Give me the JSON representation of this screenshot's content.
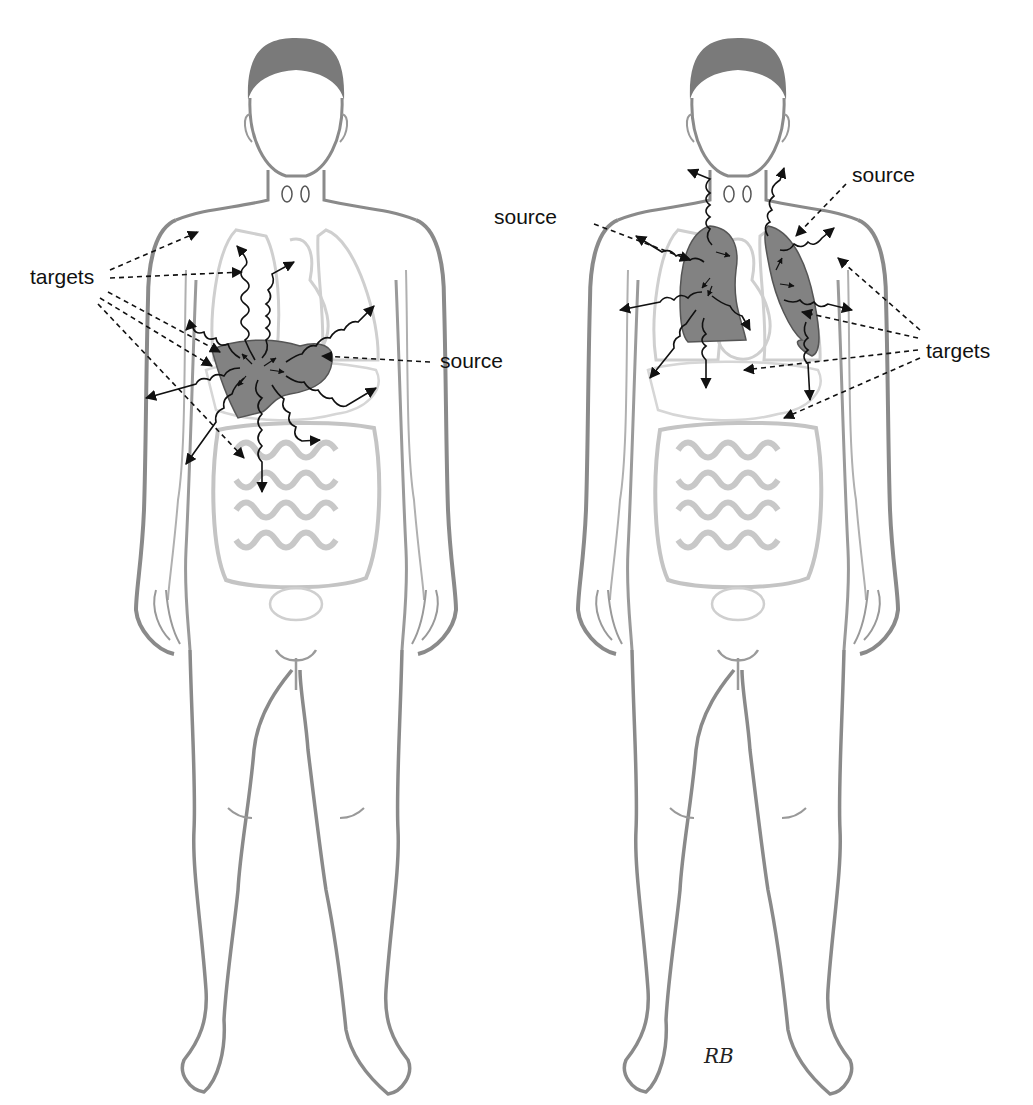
{
  "figure": {
    "colors": {
      "body_outline": "#8a8a8a",
      "organ_outline": "#c8c8c8",
      "source_fill": "#808080",
      "arrow": "#111111",
      "background": "#ffffff"
    },
    "panels": [
      {
        "id": "left",
        "source_organ": "liver",
        "labels": {
          "targets": "targets",
          "source": "source"
        }
      },
      {
        "id": "right",
        "source_organ": "lungs",
        "labels": {
          "source_left": "source",
          "source_right": "source",
          "targets": "targets"
        }
      }
    ],
    "signature": "RB"
  }
}
